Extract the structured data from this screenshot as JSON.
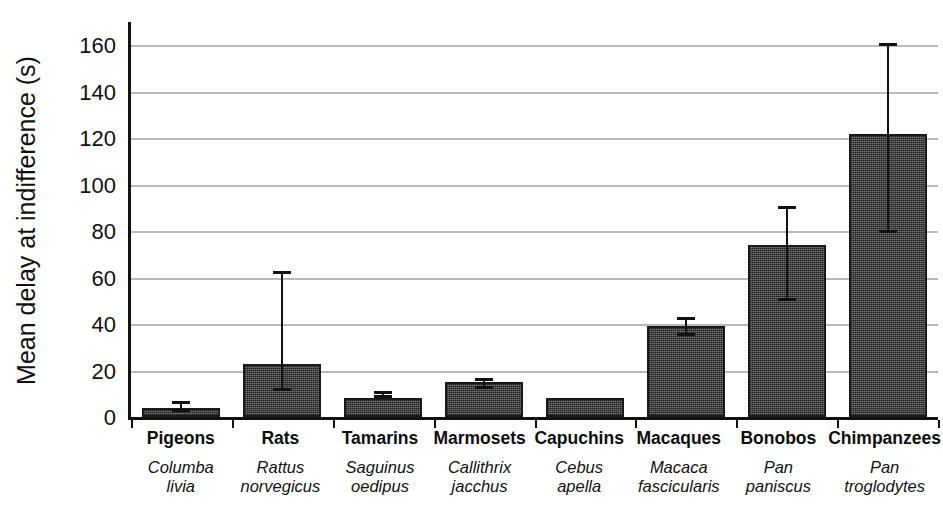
{
  "chart_data": {
    "type": "bar",
    "title": "",
    "xlabel": "",
    "ylabel": "Mean delay at indifference (s)",
    "ylim": [
      0,
      170
    ],
    "yticks": [
      0,
      20,
      40,
      60,
      80,
      100,
      120,
      140,
      160
    ],
    "ytick_labels": [
      "0",
      "20",
      "40",
      "60",
      "80",
      "100",
      "120",
      "140",
      "160"
    ],
    "grid": "horizontal",
    "legend": "none",
    "bar_color": "#555555",
    "bar_edge_color": "#1a1a1a",
    "gridline_color": "#b9b9b9",
    "axis_color": "#111111",
    "categories": [
      "Pigeons",
      "Rats",
      "Tamarins",
      "Marmosets",
      "Capuchins",
      "Macaques",
      "Bonobos",
      "Chimpanzees"
    ],
    "category_sublabels": [
      "Columba livia",
      "Rattus norvegicus",
      "Saguinus oedipus",
      "Callithrix jacchus",
      "Cebus apella",
      "Macaca fascicularis",
      "Pan paniscus",
      "Pan troglodytes"
    ],
    "values": [
      4,
      23,
      8,
      15,
      8,
      39,
      74,
      122
    ],
    "error_low": [
      2,
      11,
      8,
      12,
      null,
      35,
      50,
      79
    ],
    "error_high": [
      7,
      63,
      11,
      17,
      null,
      43,
      91,
      161
    ],
    "bars": [
      {
        "category": "Pigeons",
        "genus_species_line1": "Columba",
        "genus_species_line2": "livia",
        "value": 4,
        "err_low": 2,
        "err_high": 7,
        "has_error_bar": true
      },
      {
        "category": "Rats",
        "genus_species_line1": "Rattus",
        "genus_species_line2": "norvegicus",
        "value": 23,
        "err_low": 11,
        "err_high": 63,
        "has_error_bar": true
      },
      {
        "category": "Tamarins",
        "genus_species_line1": "Saguinus",
        "genus_species_line2": "oedipus",
        "value": 8,
        "err_low": 8,
        "err_high": 11,
        "has_error_bar": true
      },
      {
        "category": "Marmosets",
        "genus_species_line1": "Callithrix",
        "genus_species_line2": "jacchus",
        "value": 15,
        "err_low": 12,
        "err_high": 17,
        "has_error_bar": true
      },
      {
        "category": "Capuchins",
        "genus_species_line1": "Cebus",
        "genus_species_line2": "apella",
        "value": 8,
        "err_low": null,
        "err_high": null,
        "has_error_bar": false
      },
      {
        "category": "Macaques",
        "genus_species_line1": "Macaca",
        "genus_species_line2": "fascicularis",
        "value": 39,
        "err_low": 35,
        "err_high": 43,
        "has_error_bar": true
      },
      {
        "category": "Bonobos",
        "genus_species_line1": "Pan",
        "genus_species_line2": "paniscus",
        "value": 74,
        "err_low": 50,
        "err_high": 91,
        "has_error_bar": true
      },
      {
        "category": "Chimpanzees",
        "genus_species_line1": "Pan",
        "genus_species_line2": "troglodytes",
        "value": 122,
        "err_low": 79,
        "err_high": 161,
        "has_error_bar": true
      }
    ]
  }
}
